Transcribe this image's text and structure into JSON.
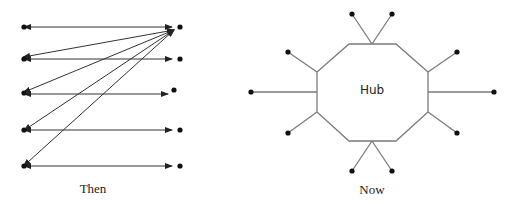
{
  "diagrams": {
    "left": {
      "caption": "Then",
      "description": "point-to-point connections",
      "left_nodes": [
        [
          24,
          27
        ],
        [
          24,
          59
        ],
        [
          24,
          93
        ],
        [
          24,
          130
        ],
        [
          24,
          166
        ]
      ],
      "right_nodes": [
        [
          180,
          27
        ],
        [
          180,
          59
        ],
        [
          174,
          90
        ],
        [
          180,
          130
        ],
        [
          180,
          166
        ]
      ]
    },
    "right": {
      "caption": "Now",
      "hub_label": "Hub",
      "octagon": [
        [
          349,
          44
        ],
        [
          396,
          44
        ],
        [
          428,
          72
        ],
        [
          428,
          112
        ],
        [
          396,
          141
        ],
        [
          349,
          141
        ],
        [
          317,
          112
        ],
        [
          317,
          72
        ]
      ]
    }
  }
}
